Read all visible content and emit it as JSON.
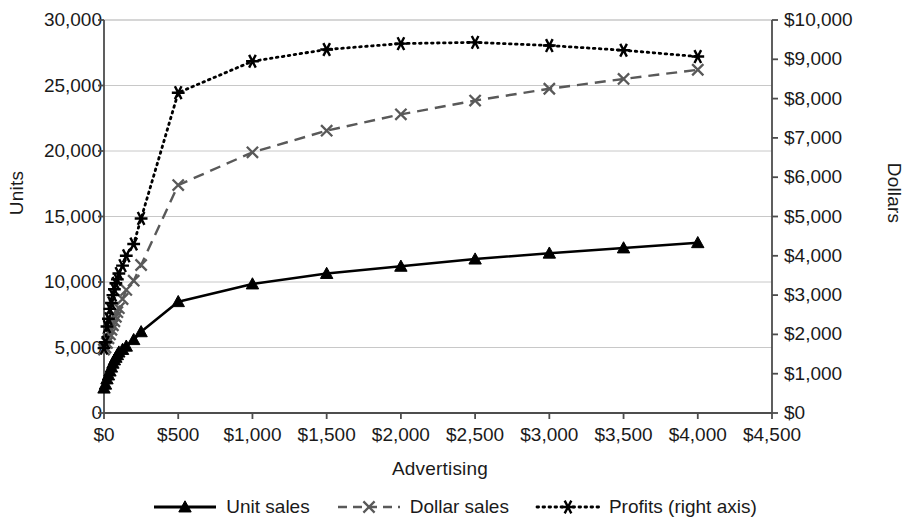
{
  "chart_data": {
    "type": "line",
    "title": "",
    "xlabel": "Advertising",
    "ylabel": "Units",
    "y2label": "Dollars",
    "xlim": [
      0,
      4500
    ],
    "ylim": [
      0,
      30000
    ],
    "y2lim": [
      0,
      10000
    ],
    "grid": true,
    "legend_position": "bottom",
    "x_ticks": [
      "$0",
      "$500",
      "$1,000",
      "$1,500",
      "$2,000",
      "$2,500",
      "$3,000",
      "$3,500",
      "$4,000",
      "$4,500"
    ],
    "x_tick_values": [
      0,
      500,
      1000,
      1500,
      2000,
      2500,
      3000,
      3500,
      4000,
      4500
    ],
    "y_ticks": [
      "0",
      "5,000",
      "10,000",
      "15,000",
      "20,000",
      "25,000",
      "30,000"
    ],
    "y_tick_values": [
      0,
      5000,
      10000,
      15000,
      20000,
      25000,
      30000
    ],
    "y2_ticks": [
      "$0",
      "$1,000",
      "$2,000",
      "$3,000",
      "$4,000",
      "$5,000",
      "$6,000",
      "$7,000",
      "$8,000",
      "$9,000",
      "$10,000"
    ],
    "y2_tick_values": [
      0,
      1000,
      2000,
      3000,
      4000,
      5000,
      6000,
      7000,
      8000,
      9000,
      10000
    ],
    "x": [
      0,
      10,
      20,
      30,
      40,
      50,
      60,
      70,
      80,
      90,
      100,
      125,
      150,
      200,
      250,
      500,
      1000,
      1500,
      2000,
      2500,
      3000,
      3500,
      4000
    ],
    "series": [
      {
        "name": "Unit sales",
        "axis": "left",
        "color": "#000000",
        "line_style": "solid",
        "marker": "triangle",
        "values": [
          1900,
          2200,
          2600,
          2900,
          3200,
          3500,
          3800,
          4050,
          4250,
          4450,
          4650,
          4850,
          5100,
          5600,
          6200,
          8500,
          9850,
          10650,
          11200,
          11750,
          12200,
          12600,
          13000
        ]
      },
      {
        "name": "Dollar sales",
        "axis": "left",
        "color": "#595959",
        "line_style": "dashed",
        "marker": "x",
        "values": [
          4850,
          5000,
          5350,
          5700,
          6000,
          6350,
          6700,
          7000,
          7350,
          7700,
          8000,
          8700,
          9400,
          10100,
          11300,
          17400,
          19900,
          21550,
          22800,
          23850,
          24750,
          25500,
          26200
        ]
      },
      {
        "name": "Profits (right axis)",
        "axis": "right",
        "color": "#000000",
        "line_style": "dotted",
        "marker": "asterisk",
        "values": [
          1650,
          1800,
          2200,
          2400,
          2650,
          2800,
          3000,
          3150,
          3300,
          3400,
          3550,
          3750,
          4000,
          4300,
          4950,
          8150,
          8950,
          9250,
          9400,
          9430,
          9350,
          9230,
          9070
        ]
      }
    ]
  },
  "axes": {
    "left_title": "Units",
    "right_title": "Dollars",
    "bottom_title": "Advertising"
  },
  "legend": {
    "items": [
      {
        "label": "Unit sales",
        "icon": "solid-line-triangle-marker"
      },
      {
        "label": "Dollar sales",
        "icon": "dashed-line-x-marker"
      },
      {
        "label": "Profits (right axis)",
        "icon": "dotted-line-asterisk-marker"
      }
    ]
  }
}
